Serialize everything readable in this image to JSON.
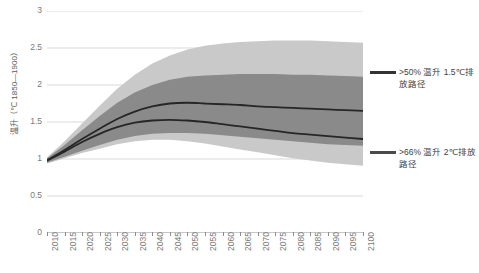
{
  "chart_data": {
    "type": "area",
    "title": "",
    "subtitle": "",
    "xlabel": "",
    "ylabel": "温升（℃ 1850—1900）",
    "xlim": [
      2010,
      2100
    ],
    "ylim": [
      0,
      3
    ],
    "y_ticks": [
      "0",
      "0.5",
      "1",
      "1.5",
      "2",
      "2.5",
      "3"
    ],
    "y_tick_values": [
      0,
      0.5,
      1,
      1.5,
      2,
      2.5,
      3
    ],
    "x_ticks": [
      "2010",
      "2015",
      "2020",
      "2025",
      "2030",
      "2035",
      "2040",
      "2045",
      "2050",
      "2055",
      "2060",
      "2065",
      "2070",
      "2075",
      "2080",
      "2085",
      "2090",
      "2095",
      "2100"
    ],
    "x_tick_values": [
      2010,
      2015,
      2020,
      2025,
      2030,
      2035,
      2040,
      2045,
      2050,
      2055,
      2060,
      2065,
      2070,
      2075,
      2080,
      2085,
      2090,
      2095,
      2100
    ],
    "grid": true,
    "grid_axis": "y",
    "legend_position": "right",
    "x": [
      2010,
      2015,
      2020,
      2025,
      2030,
      2035,
      2040,
      2045,
      2050,
      2055,
      2060,
      2065,
      2070,
      2075,
      2080,
      2085,
      2090,
      2095,
      2100
    ],
    "series": [
      {
        "name": ">66% 温升 2℃排放路径",
        "role": "median",
        "color": "#262626",
        "values": [
          0.98,
          1.12,
          1.27,
          1.41,
          1.54,
          1.64,
          1.71,
          1.75,
          1.76,
          1.75,
          1.74,
          1.73,
          1.71,
          1.7,
          1.69,
          1.68,
          1.67,
          1.66,
          1.65
        ]
      },
      {
        "name": ">66% 温升 2℃排放路径 区间",
        "role": "band",
        "color": "#c9c9c9",
        "upper": [
          1.02,
          1.24,
          1.48,
          1.72,
          1.95,
          2.14,
          2.29,
          2.4,
          2.48,
          2.53,
          2.56,
          2.58,
          2.59,
          2.6,
          2.6,
          2.6,
          2.59,
          2.58,
          2.57
        ],
        "lower": [
          0.94,
          1.01,
          1.08,
          1.14,
          1.2,
          1.24,
          1.26,
          1.26,
          1.24,
          1.21,
          1.17,
          1.13,
          1.09,
          1.05,
          1.01,
          0.98,
          0.95,
          0.93,
          0.91
        ]
      },
      {
        "name": ">50% 温升 1.5℃排放路径",
        "role": "median",
        "color": "#262626",
        "values": [
          0.98,
          1.1,
          1.23,
          1.34,
          1.43,
          1.49,
          1.52,
          1.53,
          1.52,
          1.5,
          1.47,
          1.44,
          1.41,
          1.38,
          1.35,
          1.33,
          1.31,
          1.29,
          1.27
        ]
      },
      {
        "name": ">50% 温升 1.5℃排放路径 区间",
        "role": "band",
        "color": "#8a8a8a",
        "upper": [
          1.01,
          1.19,
          1.39,
          1.58,
          1.76,
          1.9,
          2.0,
          2.07,
          2.11,
          2.13,
          2.14,
          2.15,
          2.15,
          2.15,
          2.14,
          2.14,
          2.13,
          2.12,
          2.11
        ],
        "lower": [
          0.95,
          1.03,
          1.11,
          1.19,
          1.26,
          1.31,
          1.34,
          1.35,
          1.35,
          1.34,
          1.32,
          1.3,
          1.28,
          1.26,
          1.24,
          1.22,
          1.2,
          1.19,
          1.18
        ]
      }
    ],
    "annotations": []
  },
  "legend": {
    "entries": [
      {
        "label": ">50% 温升 1.5℃排放路径",
        "color": "#333333"
      },
      {
        "label": ">66% 温升 2℃排放路径",
        "color": "#4a4a4a"
      }
    ]
  },
  "colors": {
    "band_outer": "#c9c9c9",
    "band_inner": "#8a8a8a",
    "median_line": "#262626",
    "grid": "#d9d9d9",
    "axis": "#8c8c8c",
    "tick_text": "#7a7a7a",
    "legend_text": "#3f3f3f"
  }
}
